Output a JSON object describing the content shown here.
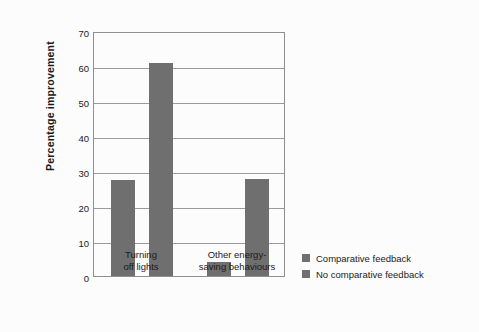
{
  "chart_data": {
    "type": "bar",
    "title": "",
    "xlabel": "",
    "ylabel": "Percentage improvement",
    "ylim": [
      0,
      70
    ],
    "yticks": [
      0,
      10,
      20,
      30,
      40,
      50,
      60,
      70
    ],
    "ytick_labels": [
      "0",
      "10",
      "20",
      "30",
      "40",
      "50",
      "60",
      "70"
    ],
    "grid": true,
    "legend_position": "right",
    "categories": [
      "Turning\noff lights",
      "Other energy-\nsaving behaviours"
    ],
    "series": [
      {
        "name": "Comparative feedback",
        "color": "#6f6f6f",
        "values": [
          27.4,
          4.0
        ]
      },
      {
        "name": "No comparative feedback",
        "color": "#6f6f6f",
        "values": [
          61.0,
          27.6
        ]
      }
    ]
  },
  "axes": {
    "y_title": "Percentage improvement",
    "y_tick_labels": [
      "70",
      "60",
      "50",
      "40",
      "30",
      "20",
      "10",
      "0"
    ],
    "x_group_labels": [
      "Turning\noff lights",
      "Other energy-\nsaving behaviours"
    ]
  },
  "legend": {
    "items": [
      {
        "label": "Comparative feedback",
        "color": "#6f6f6f"
      },
      {
        "label": "No comparative feedback",
        "color": "#6f6f6f"
      }
    ]
  },
  "colors": {
    "bar": "#6f6f6f",
    "grid": "#9a9a9a",
    "frame": "#8f8f8f",
    "text": "#1b1b1b",
    "background": "#fcfcfc"
  }
}
